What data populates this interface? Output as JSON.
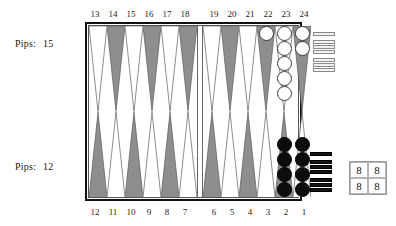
{
  "board": {
    "title": "Backgammon Board Position",
    "top_numbers": [
      13,
      14,
      15,
      16,
      17,
      18,
      19,
      20,
      21,
      22,
      23,
      24
    ],
    "bottom_numbers": [
      12,
      11,
      10,
      9,
      8,
      7,
      6,
      5,
      4,
      3,
      2,
      1
    ],
    "point_colors": {
      "top_left": [
        "white",
        "gray",
        "white",
        "gray",
        "white",
        "gray"
      ],
      "top_right": [
        "white",
        "gray",
        "white",
        "gray",
        "white",
        "gray"
      ],
      "bottom_left": [
        "gray",
        "white",
        "gray",
        "white",
        "gray",
        "white"
      ],
      "bottom_right": [
        "gray",
        "white",
        "gray",
        "white",
        "gray",
        "white"
      ]
    },
    "checkers": {
      "top_left": [
        0,
        0,
        0,
        0,
        0,
        0
      ],
      "top_right": [
        0,
        0,
        0,
        1,
        5,
        2
      ],
      "bottom_left": [
        0,
        0,
        0,
        0,
        0,
        0
      ],
      "bottom_right": [
        0,
        0,
        0,
        0,
        4,
        4
      ]
    },
    "checker_color_top": "white",
    "checker_color_bottom": "black",
    "colors": {
      "frame": "#111111",
      "point_gray": "#8e8e8e",
      "point_white": "#ffffff",
      "checker_white": "#ffffff",
      "checker_black": "#0d0d0d",
      "background": "#ffffff"
    }
  },
  "pips": {
    "top": {
      "label": "Pips:",
      "value": "15"
    },
    "bottom": {
      "label": "Pips:",
      "value": "12"
    }
  },
  "trays": {
    "white": {
      "name": "white-borne-off",
      "groups": [
        1,
        3,
        3
      ]
    },
    "black": {
      "name": "black-borne-off",
      "groups": [
        1,
        3,
        3
      ]
    }
  },
  "dice": {
    "values": [
      "8",
      "8",
      "8",
      "8"
    ]
  }
}
